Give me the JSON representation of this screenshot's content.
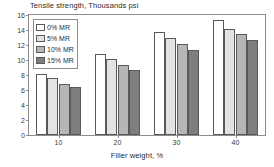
{
  "chart_data": {
    "type": "bar",
    "title": "Tensile strength, Thousands psi",
    "xlabel": "Filler weight, %",
    "ylabel": "",
    "categories": [
      "10",
      "20",
      "30",
      "40"
    ],
    "series": [
      {
        "name": "0% MR",
        "values": [
          8.2,
          10.8,
          13.7,
          15.3
        ],
        "color": "#ffffff"
      },
      {
        "name": "5% MR",
        "values": [
          7.6,
          10.1,
          13.0,
          14.2
        ],
        "color": "#e3e3e3"
      },
      {
        "name": "10% MR",
        "values": [
          6.8,
          9.4,
          12.1,
          13.5
        ],
        "color": "#b6b6b6"
      },
      {
        "name": "15% MR",
        "values": [
          6.4,
          8.7,
          11.3,
          12.7
        ],
        "color": "#7e7e7e"
      }
    ],
    "ylim": [
      0,
      16
    ],
    "y_ticks": [
      0,
      2,
      4,
      6,
      8,
      10,
      12,
      14,
      16
    ],
    "x_ticks": [
      "10",
      "20",
      "30",
      "40"
    ],
    "grid": false,
    "legend_position": "top-left",
    "legend_entries": [
      "0% MR",
      "5% MR",
      "10% MR",
      "15% MR"
    ]
  }
}
